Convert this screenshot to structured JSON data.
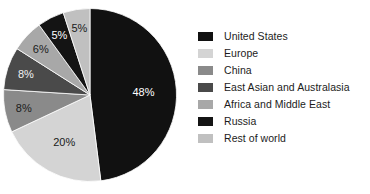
{
  "chart_data": {
    "type": "pie",
    "title": "",
    "categories": [
      "United States",
      "Europe",
      "China",
      "East Asian and Australasia",
      "Africa and Middle East",
      "Russia",
      "Rest of world"
    ],
    "values": [
      48,
      20,
      8,
      8,
      6,
      5,
      5
    ],
    "value_labels": [
      "48%",
      "20%",
      "8%",
      "8%",
      "6%",
      "5%",
      "5%"
    ],
    "colors": [
      "#111111",
      "#d4d4d4",
      "#8a8a8a",
      "#4a4a4a",
      "#a8a8a8",
      "#141414",
      "#c0c0c0"
    ],
    "label_colors": [
      "#ffffff",
      "#1a1a1a",
      "#1a1a1a",
      "#f2f2f2",
      "#1a1a1a",
      "#ffffff",
      "#1a1a1a"
    ],
    "start_angle": 0,
    "direction": "clockwise",
    "legend_position": "right",
    "grid": false,
    "xlabel": "",
    "ylabel": ""
  },
  "legend": {
    "items": [
      {
        "label": "United States",
        "color": "#111111"
      },
      {
        "label": "Europe",
        "color": "#d4d4d4"
      },
      {
        "label": "China",
        "color": "#8a8a8a"
      },
      {
        "label": "East Asian and Australasia",
        "color": "#4a4a4a"
      },
      {
        "label": "Africa and Middle East",
        "color": "#a8a8a8"
      },
      {
        "label": "Russia",
        "color": "#141414"
      },
      {
        "label": "Rest of world",
        "color": "#c0c0c0"
      }
    ]
  }
}
